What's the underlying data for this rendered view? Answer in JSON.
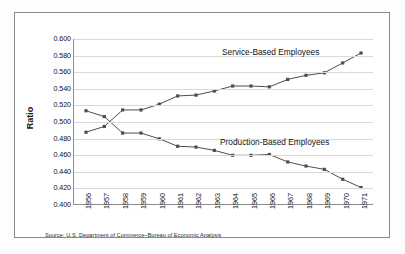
{
  "figure": {
    "source_note": "Source: U.S. Department of Commerce–Bureau of Economic Analysis",
    "frame_color": "#8a8a8a",
    "background": "#ffffff"
  },
  "chart_data": {
    "type": "line",
    "title": "",
    "subtitle": "",
    "xlabel": "",
    "ylabel": "Ratio",
    "ylim": [
      0.4,
      0.6
    ],
    "ytick_step": 0.02,
    "ytick_labels": [
      "0.600",
      "0.580",
      "0.560",
      "0.540",
      "0.520",
      "0.500",
      "0.480",
      "0.460",
      "0.440",
      "0.420",
      "0.400"
    ],
    "ytick_values": [
      0.6,
      0.58,
      0.56,
      0.54,
      0.52,
      0.5,
      0.48,
      0.46,
      0.44,
      0.42,
      0.4
    ],
    "grid": true,
    "grid_color": "#d9d9d9",
    "legend_position": "inline-annotation",
    "categories": [
      "1956",
      "1957",
      "1958",
      "1959",
      "1960",
      "1961",
      "1962",
      "1963",
      "1964",
      "1965",
      "1966",
      "1967",
      "1968",
      "1969",
      "1970",
      "1971"
    ],
    "x": [
      1956,
      1957,
      1958,
      1959,
      1960,
      1961,
      1962,
      1963,
      1964,
      1965,
      1966,
      1967,
      1968,
      1969,
      1970,
      1971
    ],
    "series": [
      {
        "name": "Service-Based Employees",
        "color": "#4d4d4d",
        "marker": "square",
        "values": [
          0.487,
          0.494,
          0.514,
          0.514,
          0.521,
          0.531,
          0.532,
          0.537,
          0.543,
          0.543,
          0.542,
          0.551,
          0.556,
          0.559,
          0.571,
          0.583
        ]
      },
      {
        "name": "Production-Based Employees",
        "color": "#4d4d4d",
        "marker": "square",
        "values": [
          0.513,
          0.506,
          0.486,
          0.486,
          0.479,
          0.47,
          0.469,
          0.465,
          0.459,
          0.459,
          0.46,
          0.451,
          0.446,
          0.442,
          0.43,
          0.42
        ]
      }
    ],
    "annotations": [
      {
        "text": "Service-Based Employees",
        "x": 1962,
        "y": 0.596
      },
      {
        "text": "Production-Based Employees",
        "x": 1962,
        "y": 0.489
      }
    ]
  }
}
